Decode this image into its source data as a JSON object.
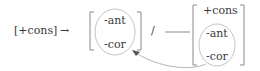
{
  "rule": {
    "input": "[+cons]",
    "arrow": "→",
    "output_features": [
      "-ant",
      "-cor"
    ],
    "slash": "/",
    "blank": "___",
    "environment_features": [
      "+cons",
      "-ant",
      "-cor"
    ]
  },
  "annotations": {
    "output_circle": "circle around -ant / -cor in output",
    "environment_circle": "circle around -ant / -cor in environment",
    "assimilation_arrow": "curved arrow from environment features to output features"
  },
  "colors": {
    "text": "#3a3a3a",
    "brackets": "#8a8a8a",
    "circles": "#c4c4c4",
    "curve": "#b5b5b5"
  }
}
